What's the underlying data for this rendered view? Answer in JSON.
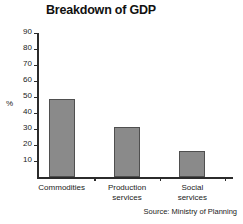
{
  "chart_data": {
    "type": "bar",
    "title": "Breakdown of GDP",
    "categories": [
      "Commodities",
      "Production services",
      "Social services"
    ],
    "values": [
      49,
      31,
      16
    ],
    "xlabel": "",
    "ylabel": "%",
    "ylim": [
      0,
      90
    ],
    "yticks": [
      10,
      20,
      30,
      40,
      50,
      60,
      70,
      80,
      90
    ],
    "ytick_labels": [
      "10",
      "20",
      "30",
      "40",
      "50",
      "60",
      "70",
      "80",
      "90"
    ],
    "grid": false,
    "legend": false,
    "bar_color": "#8a8a8a",
    "bar_edge_color": "#4f4f4f",
    "axis_color": "#2b2b2b",
    "annotations": [
      "Source: Ministry of Planning"
    ]
  },
  "category_lines": [
    [
      "Commodities"
    ],
    [
      "Production",
      "services"
    ],
    [
      "Social",
      "services"
    ]
  ],
  "source": {
    "text": "Source: Ministry of Planning"
  }
}
